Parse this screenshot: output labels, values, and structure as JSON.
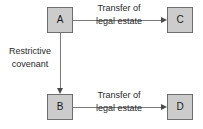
{
  "diagram": {
    "type": "flow-diagram",
    "background_color": "#ffffff",
    "node_fill_color": "#cccccc",
    "node_border_color": "#6e6e6e",
    "connector_color": "#7a7a7a",
    "nodes": [
      {
        "id": "A",
        "label": "A"
      },
      {
        "id": "C",
        "label": "C"
      },
      {
        "id": "B",
        "label": "B"
      },
      {
        "id": "D",
        "label": "D"
      }
    ],
    "edges": [
      {
        "from": "A",
        "to": "C",
        "direction": "right",
        "label_line1": "Transfer of",
        "label_line2": "legal estate"
      },
      {
        "from": "A",
        "to": "B",
        "direction": "down",
        "label_line1": "Restrictive",
        "label_line2": "covenant"
      },
      {
        "from": "B",
        "to": "D",
        "direction": "right",
        "label_line1": "Transfer of",
        "label_line2": "legal estate"
      }
    ]
  }
}
